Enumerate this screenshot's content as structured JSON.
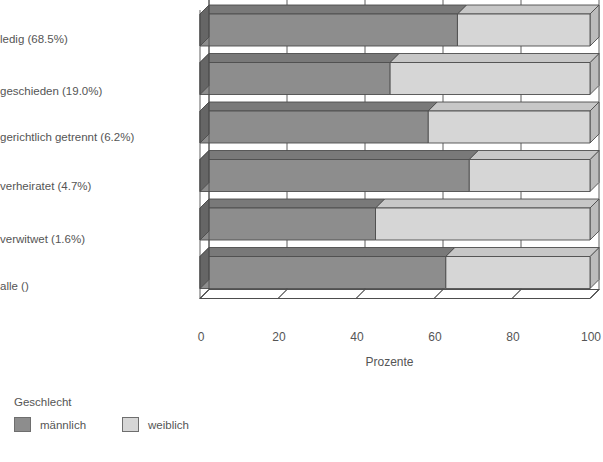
{
  "chart_data": {
    "type": "bar",
    "orientation": "horizontal",
    "stacked": true,
    "percent_stacked": true,
    "three_d": true,
    "title": "",
    "xlabel": "Prozente",
    "ylabel": "",
    "xlim": [
      0,
      100
    ],
    "xticks": [
      0,
      20,
      40,
      60,
      80,
      100
    ],
    "xtick_labels": [
      "0",
      "20",
      "40",
      "60",
      "80",
      "100"
    ],
    "grid": false,
    "legend_title": "Geschlecht",
    "legend_position": "bottom-left",
    "categories": [
      "ledig (68.5%)",
      "geschieden (19.0%)",
      "gerichtlich getrennt (6.2%)",
      "verheiratet (4.7%)",
      "verwitwet (1.6%)",
      "alle ()"
    ],
    "series": [
      {
        "name": "männlich",
        "color": "#8d8d8d",
        "values": [
          66.0,
          48.7,
          58.5,
          69.0,
          45.0,
          63.0
        ]
      },
      {
        "name": "weiblich",
        "color": "#d6d6d6",
        "values": [
          34.0,
          51.3,
          41.5,
          31.0,
          55.0,
          37.0
        ]
      }
    ]
  },
  "axis": {
    "title": "Prozente",
    "ticks": [
      "0",
      "20",
      "40",
      "60",
      "80",
      "100"
    ]
  },
  "legend": {
    "title": "Geschlecht",
    "items": [
      {
        "label": "männlich",
        "color": "#8d8d8d"
      },
      {
        "label": "weiblich",
        "color": "#d6d6d6"
      }
    ]
  }
}
